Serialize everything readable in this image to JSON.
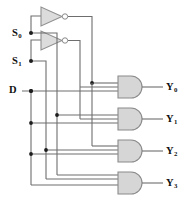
{
  "figure": {
    "kind": "logic-circuit-diagram",
    "width": 187,
    "height": 214
  },
  "colors": {
    "background": "#ffffff",
    "wire": "#6e6e6e",
    "junction": "#1d1d1d",
    "gate_fill": "#d6d6d6",
    "gate_stroke": "#8a8a8a",
    "label_text": "#111111",
    "caption_text": "#c9c9c9"
  },
  "inputs": [
    {
      "id": "s0",
      "label": "S",
      "sub": "0",
      "x": 14,
      "y": 33
    },
    {
      "id": "s1",
      "label": "S",
      "sub": "1",
      "x": 14,
      "y": 61
    },
    {
      "id": "d",
      "label": "D",
      "sub": "",
      "x": 13,
      "y": 91
    }
  ],
  "outputs": [
    {
      "id": "y0",
      "label": "Y",
      "sub": "0",
      "x": 166,
      "y": 90
    },
    {
      "id": "y1",
      "label": "Y",
      "sub": "1",
      "x": 166,
      "y": 125
    },
    {
      "id": "y2",
      "label": "Y",
      "sub": "2",
      "x": 166,
      "y": 156
    },
    {
      "id": "y3",
      "label": "Y",
      "sub": "3",
      "x": 166,
      "y": 188
    }
  ],
  "inverters": [
    {
      "id": "inv-s0",
      "name": "not-gate-s0",
      "input": "S0",
      "output": "S0-bar"
    },
    {
      "id": "inv-s1",
      "name": "not-gate-s1",
      "input": "S1",
      "output": "S1-bar"
    }
  ],
  "and_gates": [
    {
      "id": "and-y0",
      "name": "and-gate-y0",
      "output": "Y0",
      "inputs": [
        "S0-bar",
        "S1-bar",
        "D"
      ]
    },
    {
      "id": "and-y1",
      "name": "and-gate-y1",
      "output": "Y1",
      "inputs": [
        "S0",
        "S1-bar",
        "D"
      ]
    },
    {
      "id": "and-y2",
      "name": "and-gate-y2",
      "output": "Y2",
      "inputs": [
        "S0-bar",
        "S1",
        "D"
      ]
    },
    {
      "id": "and-y3",
      "name": "and-gate-y3",
      "output": "Y3",
      "inputs": [
        "S0",
        "S1",
        "D"
      ]
    }
  ],
  "caption": {
    "text": ""
  }
}
